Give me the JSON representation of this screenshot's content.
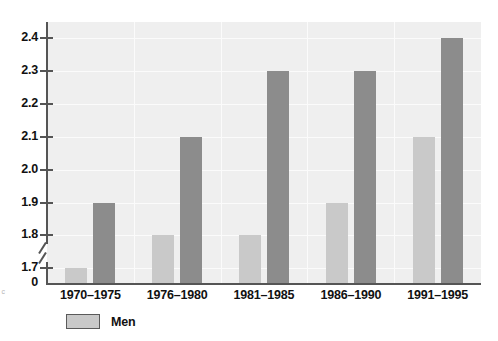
{
  "chart_data": {
    "type": "bar",
    "title": "",
    "subtitle": "",
    "xlabel": "",
    "ylabel": "",
    "categories": [
      "1970–1975",
      "1976–1980",
      "1981–1985",
      "1986–1990",
      "1991–1995"
    ],
    "series": [
      {
        "name": "Men",
        "values": [
          1.7,
          1.8,
          1.8,
          1.9,
          2.1
        ],
        "color": "#c9c9c9"
      },
      {
        "name": "",
        "values": [
          1.9,
          2.1,
          2.3,
          2.3,
          2.4
        ],
        "color": "#8c8c8c"
      }
    ],
    "ylim": [
      1.7,
      2.45
    ],
    "ytick_labels": [
      "2.4",
      "2.3",
      "2.2",
      "2.1",
      "2.0",
      "1.9",
      "1.8",
      "1.7"
    ],
    "ytick_values": [
      2.4,
      2.3,
      2.2,
      2.1,
      2.0,
      1.9,
      1.8,
      1.7
    ],
    "zero_tick_label": "0",
    "axis_break": true,
    "grid": true,
    "grid_orientation": "horizontal",
    "legend_position": "bottom-left",
    "legend": [
      {
        "label": "Men",
        "color": "#c9c9c9"
      }
    ],
    "annotations": []
  },
  "legend": {
    "men_label": "Men"
  },
  "side_note": {
    "text": "y c"
  },
  "colors": {
    "plot_background": "#efefef",
    "gridline": "#fbfbfb",
    "axis": "#555555",
    "bar_light": "#c9c9c9",
    "bar_dark": "#8c8c8c",
    "text": "#111111",
    "page_background": "#ffffff"
  }
}
